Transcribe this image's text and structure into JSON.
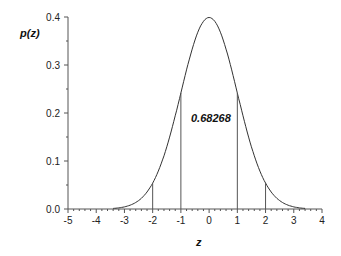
{
  "chart_data": {
    "type": "line",
    "title": "",
    "xlabel": "z",
    "ylabel": "p(z)",
    "xlim": [
      -5,
      4
    ],
    "ylim": [
      0,
      0.4
    ],
    "xticks": [
      "-5",
      "-4",
      "-3",
      "-2",
      "-1",
      "0",
      "1",
      "2",
      "3",
      "4"
    ],
    "yticks": [
      "0.0",
      "0.1",
      "0.2",
      "0.3",
      "0.4"
    ],
    "series": [
      {
        "name": "standard normal pdf",
        "function": "exp(-z^2/2)/sqrt(2*pi)",
        "domain": [
          -3.4,
          3.4
        ]
      }
    ],
    "vertical_lines": [
      -2,
      -1,
      1,
      2
    ],
    "annotation": "0.68268",
    "grid": false
  }
}
